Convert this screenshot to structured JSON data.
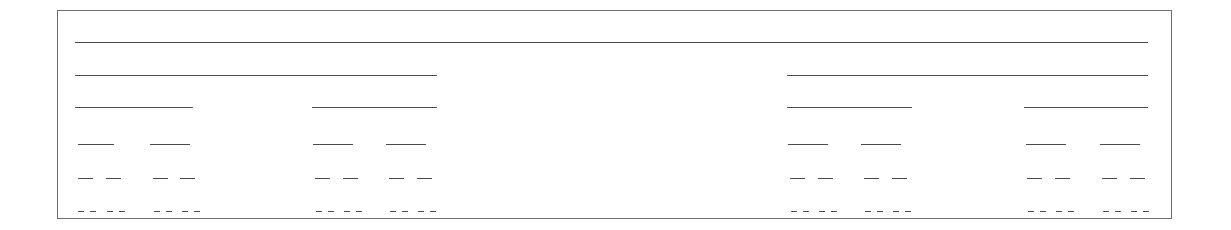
{
  "figure": {
    "canvas": {
      "width": 1231,
      "height": 230,
      "background": "#ffffff"
    },
    "frame": {
      "name": "figure-border",
      "x": 57,
      "y": 10,
      "width": 1115,
      "height": 209,
      "border_color": "#6e6e6e",
      "border_width": 1
    },
    "line_color": "#4a4a4a",
    "line_width": 1,
    "content_left": 75,
    "content_right": 1148,
    "row_count": 6,
    "rows": [
      {
        "index": 1,
        "y": 42,
        "segment_count": 1,
        "segments": [
          {
            "x": 75,
            "width": 1073
          }
        ]
      },
      {
        "index": 2,
        "y": 75,
        "segment_count": 2,
        "segments": [
          {
            "x": 75,
            "width": 362
          },
          {
            "x": 787,
            "width": 361
          }
        ]
      },
      {
        "index": 3,
        "y": 107,
        "segment_count": 4,
        "segments": [
          {
            "x": 75,
            "width": 118
          },
          {
            "x": 312,
            "width": 125
          },
          {
            "x": 787,
            "width": 125
          },
          {
            "x": 1024,
            "width": 124
          }
        ]
      },
      {
        "index": 4,
        "y": 144,
        "segment_count": 8,
        "segments": [
          {
            "x": 78,
            "width": 36
          },
          {
            "x": 150,
            "width": 40
          },
          {
            "x": 313,
            "width": 40
          },
          {
            "x": 386,
            "width": 40
          },
          {
            "x": 788,
            "width": 40
          },
          {
            "x": 861,
            "width": 40
          },
          {
            "x": 1026,
            "width": 40
          },
          {
            "x": 1100,
            "width": 40
          }
        ]
      },
      {
        "index": 5,
        "y": 178,
        "segment_count": 16,
        "segments": [
          {
            "x": 78,
            "width": 15
          },
          {
            "x": 106,
            "width": 15
          },
          {
            "x": 153,
            "width": 15
          },
          {
            "x": 180,
            "width": 15
          },
          {
            "x": 315,
            "width": 15
          },
          {
            "x": 343,
            "width": 15
          },
          {
            "x": 389,
            "width": 15
          },
          {
            "x": 417,
            "width": 15
          },
          {
            "x": 790,
            "width": 15
          },
          {
            "x": 818,
            "width": 15
          },
          {
            "x": 864,
            "width": 15
          },
          {
            "x": 892,
            "width": 15
          },
          {
            "x": 1027,
            "width": 15
          },
          {
            "x": 1055,
            "width": 15
          },
          {
            "x": 1102,
            "width": 15
          },
          {
            "x": 1130,
            "width": 15
          }
        ]
      },
      {
        "index": 6,
        "y": 211,
        "segment_count": 32,
        "segments": [
          {
            "x": 78,
            "width": 6
          },
          {
            "x": 90,
            "width": 6
          },
          {
            "x": 107,
            "width": 6
          },
          {
            "x": 119,
            "width": 6
          },
          {
            "x": 154,
            "width": 6
          },
          {
            "x": 166,
            "width": 6
          },
          {
            "x": 182,
            "width": 6
          },
          {
            "x": 194,
            "width": 6
          },
          {
            "x": 316,
            "width": 6
          },
          {
            "x": 328,
            "width": 6
          },
          {
            "x": 344,
            "width": 6
          },
          {
            "x": 356,
            "width": 6
          },
          {
            "x": 390,
            "width": 6
          },
          {
            "x": 402,
            "width": 6
          },
          {
            "x": 418,
            "width": 6
          },
          {
            "x": 430,
            "width": 6
          },
          {
            "x": 791,
            "width": 6
          },
          {
            "x": 803,
            "width": 6
          },
          {
            "x": 819,
            "width": 6
          },
          {
            "x": 831,
            "width": 6
          },
          {
            "x": 865,
            "width": 6
          },
          {
            "x": 877,
            "width": 6
          },
          {
            "x": 893,
            "width": 6
          },
          {
            "x": 905,
            "width": 6
          },
          {
            "x": 1028,
            "width": 6
          },
          {
            "x": 1040,
            "width": 6
          },
          {
            "x": 1056,
            "width": 6
          },
          {
            "x": 1068,
            "width": 6
          },
          {
            "x": 1103,
            "width": 6
          },
          {
            "x": 1115,
            "width": 6
          },
          {
            "x": 1131,
            "width": 6
          },
          {
            "x": 1143,
            "width": 6
          }
        ]
      }
    ]
  },
  "chart_data": {
    "type": "diagram",
    "title": "",
    "subtitle": "",
    "xlabel": "",
    "ylabel": "",
    "levels": [
      1,
      2,
      4,
      8,
      16,
      32
    ],
    "level_row_y": [
      42,
      75,
      107,
      144,
      178,
      211
    ],
    "grid": false,
    "legend": false
  }
}
